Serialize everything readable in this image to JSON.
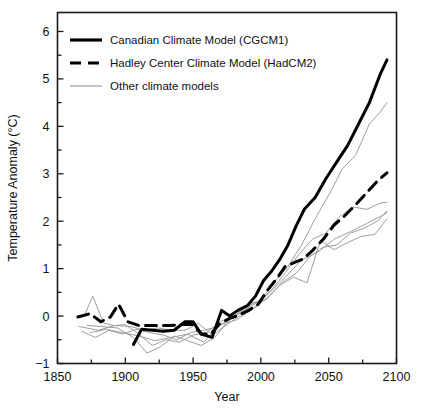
{
  "chart_data": {
    "type": "line",
    "title": "",
    "xlabel": "Year",
    "ylabel": "Temperature Anomaly (°C)",
    "xlim": [
      1850,
      2100
    ],
    "ylim": [
      -1,
      6.4
    ],
    "xticks": [
      1850,
      1900,
      1950,
      2000,
      2050,
      2100
    ],
    "xticklabels": [
      "1850",
      "1900",
      "1950",
      "2000",
      "2050",
      "2100"
    ],
    "xminor_step": 25,
    "yticks": [
      -1,
      0,
      1,
      2,
      3,
      4,
      5,
      6
    ],
    "yticklabels": [
      "−1",
      "0",
      "1",
      "2",
      "3",
      "4",
      "5",
      "6"
    ],
    "yminor_step": 0.5,
    "grid": false,
    "legend_position": "upper left",
    "series": [
      {
        "name": "Canadian Climate Model (CGCM1)",
        "style": "solid",
        "color": "#000000",
        "width": 3.0,
        "x": [
          1906,
          1912,
          1920,
          1928,
          1936,
          1944,
          1950,
          1956,
          1964,
          1971,
          1977,
          1983,
          1990,
          1996,
          2002,
          2008,
          2014,
          2020,
          2026,
          2032,
          2040,
          2048,
          2056,
          2064,
          2072,
          2080,
          2088,
          2093
        ],
        "y": [
          -0.6,
          -0.28,
          -0.3,
          -0.32,
          -0.3,
          -0.12,
          -0.12,
          -0.38,
          -0.45,
          0.12,
          0.0,
          0.12,
          0.22,
          0.42,
          0.75,
          0.95,
          1.2,
          1.5,
          1.9,
          2.25,
          2.5,
          2.9,
          3.25,
          3.6,
          4.05,
          4.5,
          5.1,
          5.4
        ]
      },
      {
        "name": "Hadley Center Climate Model (HadCM2)",
        "style": "dashed",
        "color": "#000000",
        "width": 3.0,
        "x": [
          1865,
          1874,
          1882,
          1889,
          1895,
          1902,
          1910,
          1920,
          1932,
          1942,
          1950,
          1956,
          1963,
          1970,
          1977,
          1984,
          1991,
          1998,
          2005,
          2012,
          2018,
          2024,
          2031,
          2038,
          2046,
          2054,
          2062,
          2070,
          2078,
          2086,
          2093
        ],
        "y": [
          -0.02,
          0.05,
          -0.12,
          -0.02,
          0.25,
          -0.12,
          -0.2,
          -0.2,
          -0.2,
          -0.18,
          -0.18,
          -0.38,
          -0.38,
          -0.15,
          -0.05,
          0.02,
          0.12,
          0.25,
          0.55,
          0.8,
          1.05,
          1.12,
          1.2,
          1.38,
          1.62,
          1.92,
          2.12,
          2.35,
          2.6,
          2.85,
          3.02
        ]
      },
      {
        "name": "Other climate models",
        "style": "solid",
        "color": "#9e9e9e",
        "width": 1.0,
        "members": [
          {
            "x": [
              1870,
              1876,
              1884,
              1892,
              1900,
              1910,
              1920,
              1930,
              1940,
              1950,
              1960,
              1970,
              1980,
              1990,
              2000,
              2010,
              2020,
              2030,
              2040,
              2050,
              2060,
              2070,
              2080,
              2088,
              2093
            ],
            "y": [
              0.02,
              0.42,
              -0.15,
              -0.2,
              -0.18,
              -0.38,
              -0.62,
              -0.5,
              -0.55,
              -0.4,
              -0.35,
              -0.12,
              0.0,
              0.2,
              0.35,
              0.72,
              1.05,
              1.5,
              2.05,
              2.55,
              3.1,
              3.4,
              4.05,
              4.3,
              4.5
            ]
          },
          {
            "x": [
              1868,
              1878,
              1888,
              1898,
              1908,
              1918,
              1928,
              1938,
              1948,
              1958,
              1968,
              1978,
              1988,
              1998,
              2008,
              2018,
              2028,
              2038,
              2048,
              2058,
              2068,
              2078,
              2088,
              2093
            ],
            "y": [
              -0.32,
              -0.45,
              -0.3,
              -0.38,
              -0.28,
              -0.35,
              -0.4,
              -0.5,
              -0.35,
              -0.3,
              -0.22,
              -0.05,
              0.12,
              0.3,
              0.55,
              0.92,
              1.3,
              1.62,
              1.75,
              2.1,
              2.3,
              2.25,
              2.38,
              2.4
            ]
          },
          {
            "x": [
              1872,
              1882,
              1894,
              1906,
              1916,
              1926,
              1936,
              1946,
              1956,
              1966,
              1976,
              1986,
              1996,
              2006,
              2016,
              2026,
              2036,
              2046,
              2056,
              2066,
              2076,
              2086,
              2093
            ],
            "y": [
              -0.2,
              -0.22,
              -0.25,
              -0.45,
              -0.78,
              -0.65,
              -0.42,
              -0.52,
              -0.62,
              -0.45,
              -0.1,
              0.1,
              0.18,
              0.42,
              0.72,
              0.9,
              1.25,
              1.45,
              1.5,
              1.75,
              1.85,
              2.0,
              2.22
            ]
          },
          {
            "x": [
              1866,
              1880,
              1892,
              1904,
              1914,
              1924,
              1934,
              1944,
              1954,
              1964,
              1974,
              1984,
              1994,
              2004,
              2014,
              2024,
              2034,
              2044,
              2054,
              2064,
              2074,
              2084,
              2093
            ],
            "y": [
              -0.22,
              -0.3,
              -0.2,
              -0.22,
              -0.3,
              -0.25,
              -0.3,
              -0.3,
              -0.15,
              -0.4,
              -0.2,
              0.0,
              0.28,
              0.35,
              0.65,
              0.82,
              0.7,
              1.6,
              1.4,
              1.55,
              1.68,
              1.72,
              2.05
            ]
          },
          {
            "x": [
              1874,
              1886,
              1898,
              1910,
              1922,
              1934,
              1946,
              1958,
              1970,
              1982,
              1994,
              2006,
              2018,
              2030,
              2042,
              2054,
              2066,
              2078,
              2088,
              2093
            ],
            "y": [
              -0.35,
              -0.28,
              -0.35,
              -0.42,
              -0.52,
              -0.45,
              -0.38,
              -0.55,
              -0.18,
              -0.08,
              0.15,
              0.48,
              0.82,
              1.18,
              1.35,
              1.62,
              1.78,
              1.95,
              2.1,
              2.18
            ]
          }
        ]
      }
    ],
    "legend_entries": [
      {
        "label": "Canadian Climate Model (CGCM1)",
        "style": "solid",
        "color": "#000000"
      },
      {
        "label": "Hadley Center Climate Model (HadCM2)",
        "style": "dashed",
        "color": "#000000"
      },
      {
        "label": "Other climate models",
        "style": "solid",
        "color": "#9e9e9e"
      }
    ]
  }
}
